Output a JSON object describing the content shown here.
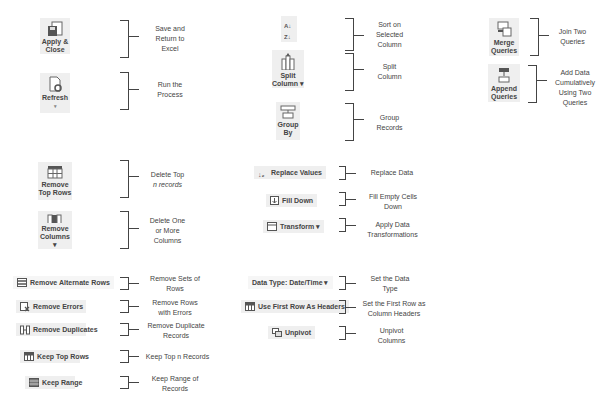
{
  "items": [
    {
      "id": "apply-close",
      "label_line1": "Apply &",
      "label_line2": "Close",
      "icon": "save-close-icon",
      "description": [
        "Save and",
        "Return to",
        "Excel"
      ]
    },
    {
      "id": "refresh",
      "label_line1": "Refresh",
      "label_line2": "▾",
      "icon": "refresh-icon",
      "description": [
        "Run the",
        "Process"
      ]
    },
    {
      "id": "sort",
      "label_line1": "",
      "label_line2": "",
      "icon": "sort-icon",
      "description": [
        "Sort on",
        "Selected",
        "Column"
      ]
    },
    {
      "id": "split-column",
      "label_line1": "Split",
      "label_line2": "Column ▾",
      "icon": "split-column-icon",
      "description": [
        "Split",
        "Column"
      ]
    },
    {
      "id": "group-by",
      "label_line1": "Group",
      "label_line2": "By",
      "icon": "group-by-icon",
      "description": [
        "Group",
        "Records"
      ]
    },
    {
      "id": "merge-queries",
      "label_line1": "Merge",
      "label_line2": "Queries",
      "icon": "merge-queries-icon",
      "description": [
        "Join Two",
        "Queries"
      ]
    },
    {
      "id": "append-queries",
      "label_line1": "Append",
      "label_line2": "Queries",
      "icon": "append-queries-icon",
      "description": [
        "Add Data",
        "Cumulatively",
        "Using Two",
        "Queries"
      ]
    },
    {
      "id": "remove-top-rows",
      "label_line1": "Remove",
      "label_line2": "Top Rows",
      "icon": "remove-top-rows-icon",
      "description": [
        "Delete Top",
        "n records"
      ]
    },
    {
      "id": "remove-columns",
      "label_line1": "Remove",
      "label_line2": "Columns ▾",
      "icon": "remove-columns-icon",
      "description": [
        "Delete One",
        "or More",
        "Columns"
      ]
    },
    {
      "id": "replace-values",
      "label": "Replace Values",
      "icon": "replace-values-icon",
      "description": [
        "Replace Data"
      ]
    },
    {
      "id": "fill-down",
      "label": "Fill Down",
      "icon": "fill-down-icon",
      "description": [
        "Fill Empty Cells",
        "Down"
      ]
    },
    {
      "id": "transform",
      "label": "Transform ▾",
      "icon": "transform-icon",
      "description": [
        "Apply Data",
        "Transformations"
      ]
    },
    {
      "id": "remove-alternate-rows",
      "label": "Remove Alternate Rows",
      "icon": "remove-alternate-rows-icon",
      "description": [
        "Remove Sets of",
        "Rows"
      ]
    },
    {
      "id": "remove-errors",
      "label": "Remove Errors",
      "icon": "remove-errors-icon",
      "description": [
        "Remove Rows",
        "with Errors"
      ]
    },
    {
      "id": "remove-duplicates",
      "label": "Remove Duplicates",
      "icon": "remove-duplicates-icon",
      "description": [
        "Remove Duplicate",
        "Records"
      ]
    },
    {
      "id": "keep-top-rows",
      "label": "Keep Top Rows",
      "icon": "keep-top-rows-icon",
      "description": [
        "Keep Top n Records"
      ]
    },
    {
      "id": "keep-range",
      "label": "Keep Range",
      "icon": "keep-range-icon",
      "description": [
        "Keep Range of",
        "Records"
      ]
    },
    {
      "id": "data-type",
      "label": "Data Type: Date/Time ▾",
      "icon": "",
      "description": [
        "Set the Data",
        "Type"
      ]
    },
    {
      "id": "use-first-row",
      "label": "Use First Row As Headers",
      "icon": "use-first-row-headers-icon",
      "description": [
        "Set the First Row as",
        "Column Headers"
      ]
    },
    {
      "id": "unpivot",
      "label": "Unpivot",
      "icon": "unpivot-icon",
      "description": [
        "Unpivot",
        "Columns"
      ]
    }
  ]
}
